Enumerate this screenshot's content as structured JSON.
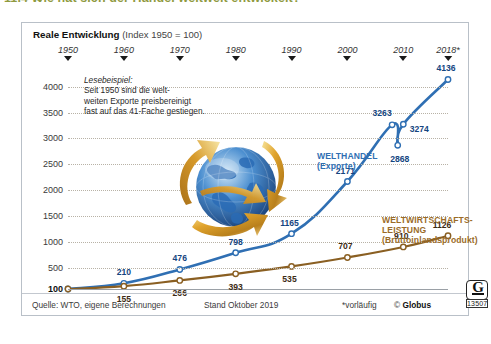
{
  "page": {
    "heading": "11.4     Wie hat sich der Handel weltweit entwickelt?",
    "heading_color": "#8f9a3f"
  },
  "card": {
    "subtitle_strong": "Reale Entwicklung",
    "subtitle_rest": "(Index 1950 = 100)"
  },
  "note": {
    "title": "Lesebeispiel:",
    "line1": "Seit 1950 sind die welt-",
    "line2": "weiten Exporte preisbereinigt",
    "line3": "fast auf das 41-Fache gestiegen."
  },
  "callouts": {
    "blue_line1": "WELTHANDEL",
    "blue_line2": "(Exporte)",
    "brown_line1": "WELTWIRTSCHAFTS-",
    "brown_line2": "LEISTUNG",
    "brown_line3": "(Bruttoinlandsprodukt)"
  },
  "footer": {
    "source": "Quelle: WTO, eigene Berechnungen",
    "stand": "Stand Oktober 2019",
    "provisional": "*vorläufig",
    "copyright_mark": "©",
    "copyright_name": "Globus",
    "number": "13507",
    "logo_letter": "G"
  },
  "chart_data": {
    "type": "line",
    "title": "Reale Entwicklung (Index 1950 = 100)",
    "xlabel": "",
    "ylabel": "",
    "ylim": [
      100,
      4300
    ],
    "grid": true,
    "legend_position": "inline-callout",
    "yticks": [
      100,
      500,
      1000,
      1500,
      2000,
      2500,
      3000,
      3500,
      4000
    ],
    "xticks": [
      "1950",
      "1960",
      "1970",
      "1980",
      "1990",
      "2000",
      "2010",
      "2018*"
    ],
    "x": [
      1950,
      1960,
      1970,
      1980,
      1990,
      2000,
      2008,
      2009,
      2010,
      2018
    ],
    "series": [
      {
        "name": "WELTHANDEL (Exporte)",
        "color": "#2f6fb3",
        "labeled_points": [
          {
            "x": 1950,
            "y": 100,
            "label": "100",
            "show": false
          },
          {
            "x": 1960,
            "y": 210,
            "label": "210",
            "show": true
          },
          {
            "x": 1970,
            "y": 476,
            "label": "476",
            "show": true
          },
          {
            "x": 1980,
            "y": 798,
            "label": "798",
            "show": true
          },
          {
            "x": 1990,
            "y": 1165,
            "label": "1165",
            "show": true
          },
          {
            "x": 2000,
            "y": 2171,
            "label": "2171",
            "show": true
          },
          {
            "x": 2008,
            "y": 3263,
            "label": "3263",
            "show": true
          },
          {
            "x": 2009,
            "y": 2868,
            "label": "2868",
            "show": true
          },
          {
            "x": 2010,
            "y": 3274,
            "label": "3274",
            "show": true
          },
          {
            "x": 2018,
            "y": 4136,
            "label": "4136",
            "show": true
          }
        ]
      },
      {
        "name": "WELTWIRTSCHAFTSLEISTUNG (Bruttoinlandsprodukt)",
        "color": "#8a5f22",
        "labeled_points": [
          {
            "x": 1950,
            "y": 100,
            "label": "100",
            "show": false
          },
          {
            "x": 1960,
            "y": 155,
            "label": "155",
            "show": true
          },
          {
            "x": 1970,
            "y": 266,
            "label": "266",
            "show": true
          },
          {
            "x": 1980,
            "y": 393,
            "label": "393",
            "show": true
          },
          {
            "x": 1990,
            "y": 535,
            "label": "535",
            "show": true
          },
          {
            "x": 2000,
            "y": 707,
            "label": "707",
            "show": true
          },
          {
            "x": 2010,
            "y": 910,
            "label": "910",
            "show": true
          },
          {
            "x": 2018,
            "y": 1126,
            "label": "1126",
            "show": true
          }
        ]
      }
    ],
    "labels": {
      "y100": "100",
      "y500": "500",
      "y1000": "1000",
      "y1500": "1500",
      "y2000": "2000",
      "y2500": "2500",
      "y3000": "3000",
      "y3500": "3500",
      "y4000": "4000",
      "blue": [
        "210",
        "476",
        "798",
        "1165",
        "2171",
        "3263",
        "2868",
        "3274",
        "4136"
      ],
      "brown": [
        "155",
        "266",
        "393",
        "535",
        "707",
        "910",
        "1126"
      ]
    }
  }
}
